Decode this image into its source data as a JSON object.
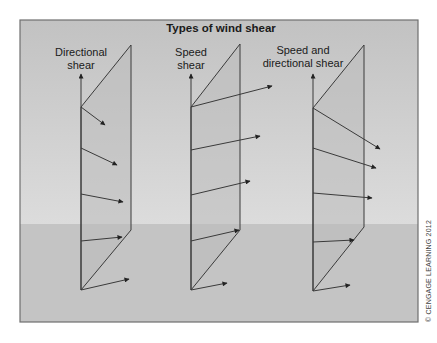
{
  "figure": {
    "title": "Types of wind shear",
    "credit": "© CENGAGE LEARNING 2012",
    "colors": {
      "frame_border": "#6f6f6f",
      "upper_band_top": "#c2c2c2",
      "upper_band_bottom": "#dcdcdc",
      "lower_band": "#c4c4c4",
      "panel_fill": "#bcbcbc",
      "line": "#3a3a3a"
    },
    "frame": {
      "x": 20,
      "y": 20,
      "width": 398,
      "height": 302,
      "band_split_y": 224
    }
  },
  "panels": [
    {
      "id": "directional",
      "label_lines": [
        "Directional",
        "shear"
      ],
      "label_x": 81,
      "label_y": [
        56,
        69
      ],
      "axis": {
        "x": 81,
        "y_bottom": 290,
        "y_top": 74
      },
      "outline": [
        [
          81,
          290
        ],
        [
          131,
          230
        ],
        [
          131,
          45
        ],
        [
          81,
          107
        ]
      ],
      "arrows": [
        [
          [
            81,
            107
          ],
          [
            105,
            125
          ]
        ],
        [
          [
            81,
            148
          ],
          [
            117,
            165
          ]
        ],
        [
          [
            81,
            194
          ],
          [
            123,
            202
          ]
        ],
        [
          [
            81,
            241
          ],
          [
            122,
            237
          ]
        ],
        [
          [
            81,
            290
          ],
          [
            129,
            279
          ]
        ]
      ]
    },
    {
      "id": "speed",
      "label_lines": [
        "Speed",
        "shear"
      ],
      "label_x": 191,
      "label_y": [
        56,
        69
      ],
      "axis": {
        "x": 191,
        "y_bottom": 290,
        "y_top": 74
      },
      "outline": [
        [
          191,
          290
        ],
        [
          240,
          230
        ],
        [
          240,
          44
        ],
        [
          191,
          107
        ]
      ],
      "arrows": [
        [
          [
            191,
            107
          ],
          [
            272,
            86
          ]
        ],
        [
          [
            191,
            150
          ],
          [
            260,
            136
          ]
        ],
        [
          [
            191,
            195
          ],
          [
            250,
            181
          ]
        ],
        [
          [
            191,
            241
          ],
          [
            239,
            230
          ]
        ],
        [
          [
            191,
            290
          ],
          [
            227,
            283
          ]
        ]
      ]
    },
    {
      "id": "speed-and-directional",
      "label_lines": [
        "Speed and",
        "directional shear"
      ],
      "label_x": 303,
      "label_y": [
        54,
        67
      ],
      "axis": {
        "x": 313,
        "y_bottom": 291,
        "y_top": 74
      },
      "outline": [
        [
          313,
          291
        ],
        [
          364,
          227
        ],
        [
          364,
          45
        ],
        [
          313,
          108
        ]
      ],
      "arrows": [
        [
          [
            313,
            108
          ],
          [
            380,
            149
          ]
        ],
        [
          [
            313,
            148
          ],
          [
            376,
            168
          ]
        ],
        [
          [
            313,
            193
          ],
          [
            372,
            198
          ]
        ],
        [
          [
            313,
            242
          ],
          [
            354,
            240
          ]
        ],
        [
          [
            313,
            291
          ],
          [
            350,
            285
          ]
        ]
      ]
    }
  ]
}
